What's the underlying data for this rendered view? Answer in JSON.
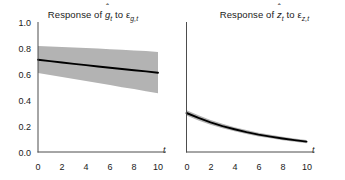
{
  "figure": {
    "background_color": "#ffffff",
    "line_color": "#000000",
    "band_color": "#b3b3b3",
    "axis_color": "#4d4d4d"
  },
  "panels": [
    {
      "id": "left",
      "title_prefix": "Response of ",
      "title_var_base": "g",
      "title_var_hat": "ˆ",
      "title_var_sub": "t",
      "title_mid": " to ",
      "title_shock": "ε",
      "title_shock_sub": "g,t",
      "title_plain": "Response of ĝₜ to εg,t"
    },
    {
      "id": "right",
      "title_prefix": "Response of ",
      "title_var_base": "z",
      "title_var_hat": "ˆ",
      "title_var_sub": "t",
      "title_mid": " to ",
      "title_shock": "ε",
      "title_shock_sub": "z,t",
      "title_plain": "Response of ẑₜ to εz,t"
    }
  ],
  "axes": {
    "y_ticks": [
      "1.0",
      "0.8",
      "0.6",
      "0.4",
      "0.2",
      "0.0"
    ],
    "x_ticks": [
      "0",
      "2",
      "4",
      "6",
      "8",
      "10"
    ],
    "x_axis_variable": "t",
    "ylim": [
      0.0,
      1.0
    ],
    "xlim": [
      0,
      10
    ]
  },
  "chart_data": [
    {
      "type": "line",
      "panel": "left",
      "title": "Response of ĝₜ to εg,t",
      "xlabel": "t",
      "ylabel": "",
      "xlim": [
        0,
        10
      ],
      "ylim": [
        0.0,
        1.0
      ],
      "grid": false,
      "legend": "none",
      "x": [
        0,
        1,
        2,
        3,
        4,
        5,
        6,
        7,
        8,
        9,
        10
      ],
      "series": [
        {
          "name": "impulse response",
          "style": "solid-black",
          "values": [
            0.71,
            0.699,
            0.688,
            0.678,
            0.668,
            0.658,
            0.648,
            0.639,
            0.629,
            0.62,
            0.61
          ]
        },
        {
          "name": "confidence band upper",
          "style": "gray-band",
          "values": [
            0.815,
            0.812,
            0.808,
            0.804,
            0.8,
            0.796,
            0.791,
            0.786,
            0.781,
            0.776,
            0.77
          ]
        },
        {
          "name": "confidence band lower",
          "style": "gray-band",
          "values": [
            0.608,
            0.592,
            0.577,
            0.561,
            0.546,
            0.53,
            0.515,
            0.499,
            0.484,
            0.468,
            0.452
          ]
        }
      ]
    },
    {
      "type": "line",
      "panel": "right",
      "title": "Response of ẑₜ to εz,t",
      "xlabel": "t",
      "ylabel": "",
      "xlim": [
        0,
        10
      ],
      "ylim": [
        0.0,
        1.0
      ],
      "grid": false,
      "legend": "none",
      "x": [
        0,
        1,
        2,
        3,
        4,
        5,
        6,
        7,
        8,
        9,
        10
      ],
      "series": [
        {
          "name": "impulse response",
          "style": "solid-black",
          "values": [
            0.3,
            0.262,
            0.228,
            0.199,
            0.175,
            0.153,
            0.134,
            0.118,
            0.104,
            0.091,
            0.08
          ]
        },
        {
          "name": "confidence band upper",
          "style": "gray-band",
          "values": [
            0.322,
            0.282,
            0.247,
            0.217,
            0.191,
            0.169,
            0.149,
            0.132,
            0.117,
            0.104,
            0.093
          ]
        },
        {
          "name": "confidence band lower",
          "style": "gray-band",
          "values": [
            0.28,
            0.243,
            0.21,
            0.182,
            0.159,
            0.138,
            0.12,
            0.105,
            0.091,
            0.079,
            0.068
          ]
        }
      ]
    }
  ]
}
